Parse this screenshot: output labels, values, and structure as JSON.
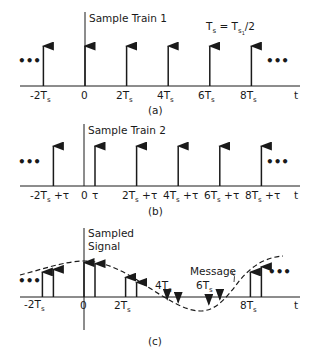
{
  "panels": [
    {
      "id": "a",
      "caption": "(a)",
      "title": "Sample Train 1",
      "annotation": {
        "lhs": "T",
        "lhs_sub": "s",
        "eq": " = T",
        "rhs_sub": "s",
        "rhs_sub2": "1",
        "tail": "/2"
      },
      "ellipsis": "•••",
      "axis_label": "t",
      "ticks": [
        {
          "main": "-2T",
          "sub": "s",
          "suffix": ""
        },
        {
          "main": "0",
          "sub": "",
          "suffix": ""
        },
        {
          "main": "2T",
          "sub": "s",
          "suffix": ""
        },
        {
          "main": "4T",
          "sub": "s",
          "suffix": ""
        },
        {
          "main": "6T",
          "sub": "s",
          "suffix": ""
        },
        {
          "main": "8T",
          "sub": "s",
          "suffix": ""
        }
      ],
      "impulses": [
        -2,
        0,
        2,
        4,
        6,
        8
      ]
    },
    {
      "id": "b",
      "caption": "(b)",
      "title": "Sample Train 2",
      "ellipsis": "•••",
      "axis_label": "t",
      "ticks": [
        {
          "main": "-2T",
          "sub": "s",
          "suffix": " +τ"
        },
        {
          "main": "0",
          "sub": "",
          "suffix": ""
        },
        {
          "main": "τ",
          "sub": "",
          "suffix": ""
        },
        {
          "main": "2T",
          "sub": "s",
          "suffix": " +τ"
        },
        {
          "main": "4T",
          "sub": "s",
          "suffix": " +τ"
        },
        {
          "main": "6T",
          "sub": "s",
          "suffix": " +τ"
        },
        {
          "main": "8T",
          "sub": "s",
          "suffix": " +τ"
        }
      ],
      "impulse_offset": "τ",
      "impulses": [
        -2,
        0,
        2,
        4,
        6,
        8
      ]
    },
    {
      "id": "c",
      "caption": "(c)",
      "title_line1": "Sampled",
      "title_line2": "Signal",
      "message_label": "Message",
      "ellipsis": "•••",
      "axis_label": "t",
      "ticks": [
        {
          "main": "-2T",
          "sub": "s"
        },
        {
          "main": "0",
          "sub": ""
        },
        {
          "main": "2T",
          "sub": "s"
        },
        {
          "main": "4T",
          "sub": "s"
        },
        {
          "main": "6T",
          "sub": "s"
        },
        {
          "main": "8T",
          "sub": "s"
        }
      ],
      "sample_values": [
        {
          "t": "-2Ts",
          "value": 0.52
        },
        {
          "t": "-2Ts+tau",
          "value": 0.57
        },
        {
          "t": "0",
          "value": 0.7
        },
        {
          "t": "tau",
          "value": 0.68
        },
        {
          "t": "2Ts",
          "value": 0.42
        },
        {
          "t": "2Ts+tau",
          "value": 0.32
        },
        {
          "t": "4Ts",
          "value": -0.08
        },
        {
          "t": "4Ts+tau",
          "value": -0.14
        },
        {
          "t": "6Ts",
          "value": -0.18
        },
        {
          "t": "6Ts+tau",
          "value": -0.08
        },
        {
          "t": "8Ts",
          "value": 0.52
        },
        {
          "t": "8Ts+tau",
          "value": 0.62
        }
      ]
    }
  ]
}
